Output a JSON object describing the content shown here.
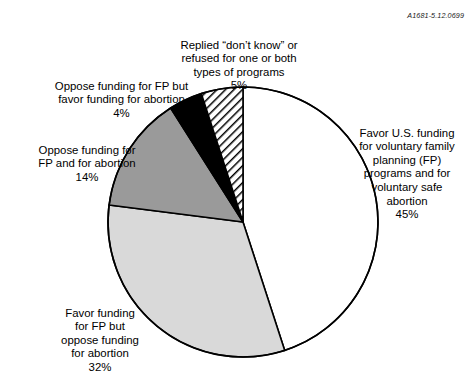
{
  "figure": {
    "reference_code": "A1681-5.12.0699"
  },
  "chart_data": {
    "type": "pie",
    "title": "",
    "subtitle": "",
    "xlabel": "",
    "ylabel": "",
    "units": "percent",
    "total": 100,
    "start_angle_deg": 0,
    "direction": "clockwise",
    "legend_position": "callout-labels",
    "grid": false,
    "categories": [
      "Favor U.S. funding for voluntary family planning (FP) programs and for voluntary safe abortion",
      "Favor funding for FP but oppose funding for abortion",
      "Oppose funding for FP and for abortion",
      "Oppose funding for FP but favor funding for abortion",
      "Replied “don’t know” or refused for one or both types of programs"
    ],
    "values": [
      45,
      32,
      14,
      4,
      5
    ],
    "slices": [
      {
        "key": "favor-both",
        "value": 45,
        "value_label": "45%",
        "fill": "#ffffff",
        "pattern": "solid",
        "start_deg": 0,
        "end_deg": 162,
        "label_lines": [
          "Favor U.S. funding",
          "for voluntary family",
          "planning (FP)",
          "programs and for",
          "voluntary safe",
          "abortion"
        ]
      },
      {
        "key": "favor-fp-oppose-abortion",
        "value": 32,
        "value_label": "32%",
        "fill": "#d9d9d9",
        "pattern": "solid",
        "start_deg": 162,
        "end_deg": 277.2,
        "label_lines": [
          "Favor funding",
          "for FP but",
          "oppose funding",
          "for abortion"
        ]
      },
      {
        "key": "oppose-both",
        "value": 14,
        "value_label": "14%",
        "fill": "#9a9a9a",
        "pattern": "solid",
        "start_deg": 277.2,
        "end_deg": 327.6,
        "label_lines": [
          "Oppose funding for",
          "FP and for abortion"
        ]
      },
      {
        "key": "oppose-fp-favor-abortion",
        "value": 4,
        "value_label": "4%",
        "fill": "#000000",
        "pattern": "solid",
        "start_deg": 327.6,
        "end_deg": 342,
        "label_lines": [
          "Oppose funding for FP but",
          "favor funding for abortion"
        ]
      },
      {
        "key": "dont-know",
        "value": 5,
        "value_label": "5%",
        "fill": "#ffffff",
        "pattern": "diagonal-hatch",
        "start_deg": 342,
        "end_deg": 360,
        "label_lines": [
          "Replied “don’t know” or",
          "refused for one or both",
          "types of programs"
        ]
      }
    ]
  }
}
